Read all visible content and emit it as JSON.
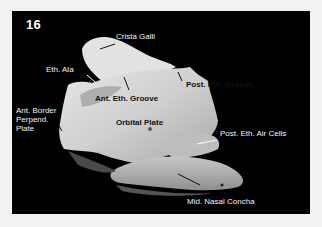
{
  "figure": {
    "number": "16",
    "background_color": "#000000",
    "page_color": "#f2f2f2"
  },
  "labels": {
    "crista_galli": "Crista Galli",
    "eth_ala": "Eth. Ala",
    "ant_eth_groove": "Ant. Eth. Groove",
    "post_eth_groove": "Post. Eth. Groove",
    "ant_border_perpend_plate": "Ant. Border\nPerpend.\nPlate",
    "orbital_plate": "Orbital Plate",
    "post_eth_air_cells": "Post. Eth. Air Cells",
    "mid_nasal_concha": "Mid. Nasal Concha"
  }
}
